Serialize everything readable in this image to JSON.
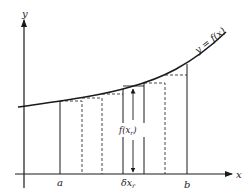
{
  "figure": {
    "type": "rectangle-approximation-of-integral",
    "axes": {
      "x_label": "x",
      "y_label": "y"
    },
    "curve": {
      "label": "y = f(x)"
    },
    "interval": {
      "lower_label": "a",
      "upper_label": "b"
    },
    "strip": {
      "width_label": "δx",
      "width_subscript": "r",
      "height_label_prefix": "f(x",
      "height_subscript": "r",
      "height_label_suffix": ")"
    },
    "colors": {
      "ink": "#1a1a1a",
      "background": "#ffffff"
    }
  }
}
